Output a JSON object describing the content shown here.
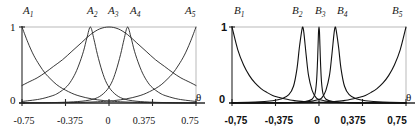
{
  "figure": {
    "panels": [
      {
        "id": "A",
        "top_labels": [
          {
            "base": "A",
            "sub": "1"
          },
          {
            "base": "A",
            "sub": "2"
          },
          {
            "base": "A",
            "sub": "3"
          },
          {
            "base": "A",
            "sub": "4"
          },
          {
            "base": "A",
            "sub": "5"
          }
        ],
        "y_ticks": [
          "1",
          "0"
        ],
        "x_ticks": [
          "-0.75",
          "-0.375",
          "0",
          "0.375",
          "0.75"
        ],
        "x_axis_symbol": "θ"
      },
      {
        "id": "B",
        "top_labels": [
          {
            "base": "B",
            "sub": "1"
          },
          {
            "base": "B",
            "sub": "2"
          },
          {
            "base": "B",
            "sub": "3"
          },
          {
            "base": "B",
            "sub": "4"
          },
          {
            "base": "B",
            "sub": "5"
          }
        ],
        "y_ticks": [
          "1",
          "0"
        ],
        "x_ticks": [
          "-0,75",
          "-0,375",
          "0",
          "0,375",
          "0,75"
        ],
        "x_axis_symbol": "θ"
      }
    ]
  },
  "chart_data": [
    {
      "type": "line",
      "title": "",
      "xlabel": "θ",
      "ylabel": "",
      "xlim": [
        -0.75,
        0.75
      ],
      "ylim": [
        0,
        1
      ],
      "xticks": [
        -0.75,
        -0.375,
        0,
        0.375,
        0.75
      ],
      "xticklabels": [
        "-0.75",
        "-0.375",
        "0",
        "0.375",
        "0.75"
      ],
      "yticks": [
        0,
        1
      ],
      "yticklabels": [
        "0",
        "1"
      ],
      "grid": false,
      "legend": "top-outside",
      "line_color": "#222222",
      "line_width": 0.9,
      "series": [
        {
          "name": "A1",
          "shape": "exponential-decay",
          "center": -0.75,
          "width": 0.42,
          "peak": 1.0,
          "x": [
            -0.75,
            -0.7,
            -0.65,
            -0.6,
            -0.55,
            -0.5,
            -0.45,
            -0.4,
            -0.35,
            -0.3,
            -0.25,
            -0.2,
            -0.15,
            -0.1,
            -0.05,
            0.0,
            0.1,
            0.2,
            0.3,
            0.45,
            0.6,
            0.75
          ],
          "y": [
            1.0,
            0.8,
            0.63,
            0.5,
            0.39,
            0.31,
            0.24,
            0.19,
            0.15,
            0.115,
            0.09,
            0.07,
            0.055,
            0.042,
            0.033,
            0.026,
            0.016,
            0.01,
            0.006,
            0.003,
            0.001,
            0.0
          ]
        },
        {
          "name": "A2",
          "shape": "sharp-peak",
          "center": -0.16,
          "width": 0.1,
          "peak": 1.0,
          "x": [
            -0.75,
            -0.6,
            -0.5,
            -0.45,
            -0.4,
            -0.35,
            -0.3,
            -0.26,
            -0.22,
            -0.19,
            -0.16,
            -0.13,
            -0.1,
            -0.06,
            -0.02,
            0.03,
            0.1,
            0.2,
            0.35,
            0.55,
            0.75
          ],
          "y": [
            0.02,
            0.05,
            0.09,
            0.12,
            0.17,
            0.24,
            0.36,
            0.5,
            0.68,
            0.86,
            1.0,
            0.84,
            0.64,
            0.42,
            0.26,
            0.15,
            0.07,
            0.03,
            0.012,
            0.004,
            0.002
          ]
        },
        {
          "name": "A3",
          "shape": "broad-bell",
          "center": 0.0,
          "width": 0.36,
          "peak": 1.0,
          "x": [
            -0.75,
            -0.7,
            -0.62,
            -0.55,
            -0.48,
            -0.4,
            -0.32,
            -0.24,
            -0.16,
            -0.08,
            0.0,
            0.08,
            0.16,
            0.24,
            0.32,
            0.4,
            0.48,
            0.55,
            0.62,
            0.7,
            0.75
          ],
          "y": [
            0.23,
            0.27,
            0.33,
            0.4,
            0.48,
            0.57,
            0.68,
            0.79,
            0.9,
            0.975,
            1.0,
            0.975,
            0.9,
            0.79,
            0.68,
            0.57,
            0.48,
            0.4,
            0.33,
            0.27,
            0.23
          ]
        },
        {
          "name": "A4",
          "shape": "sharp-peak",
          "center": 0.16,
          "width": 0.1,
          "peak": 1.0,
          "x": [
            -0.75,
            -0.55,
            -0.35,
            -0.2,
            -0.1,
            -0.03,
            0.02,
            0.06,
            0.1,
            0.13,
            0.16,
            0.19,
            0.22,
            0.26,
            0.3,
            0.35,
            0.4,
            0.45,
            0.5,
            0.6,
            0.75
          ],
          "y": [
            0.002,
            0.004,
            0.012,
            0.03,
            0.07,
            0.15,
            0.26,
            0.42,
            0.64,
            0.84,
            1.0,
            0.86,
            0.68,
            0.5,
            0.36,
            0.24,
            0.17,
            0.12,
            0.09,
            0.05,
            0.02
          ]
        },
        {
          "name": "A5",
          "shape": "exponential-rise",
          "center": 0.75,
          "width": 0.42,
          "peak": 1.0,
          "x": [
            -0.75,
            -0.6,
            -0.45,
            -0.3,
            -0.2,
            -0.1,
            0.0,
            0.05,
            0.1,
            0.15,
            0.2,
            0.25,
            0.3,
            0.35,
            0.4,
            0.45,
            0.5,
            0.55,
            0.6,
            0.65,
            0.7,
            0.75
          ],
          "y": [
            0.0,
            0.001,
            0.003,
            0.006,
            0.01,
            0.016,
            0.026,
            0.033,
            0.042,
            0.055,
            0.07,
            0.09,
            0.115,
            0.15,
            0.19,
            0.24,
            0.31,
            0.39,
            0.5,
            0.63,
            0.8,
            1.0
          ]
        }
      ]
    },
    {
      "type": "line",
      "title": "",
      "xlabel": "θ",
      "ylabel": "",
      "xlim": [
        -0.75,
        0.75
      ],
      "ylim": [
        0,
        1
      ],
      "xticks": [
        -0.75,
        -0.375,
        0,
        0.375,
        0.75
      ],
      "xticklabels": [
        "-0,75",
        "-0,375",
        "0",
        "0,375",
        "0,75"
      ],
      "yticks": [
        0,
        1
      ],
      "yticklabels": [
        "0",
        "1"
      ],
      "grid": false,
      "legend": "top-outside",
      "line_color": "#111111",
      "line_width": 1.1,
      "series": [
        {
          "name": "B1",
          "shape": "steep-exponential-decay",
          "center": -0.75,
          "width": 0.22,
          "peak": 1.0,
          "x": [
            -0.75,
            -0.7,
            -0.65,
            -0.6,
            -0.55,
            -0.5,
            -0.45,
            -0.4,
            -0.35,
            -0.3,
            -0.25,
            -0.2,
            -0.15,
            -0.1,
            -0.05,
            0.0,
            0.15,
            0.35,
            0.55,
            0.75
          ],
          "y": [
            1.0,
            0.7,
            0.5,
            0.36,
            0.26,
            0.19,
            0.14,
            0.1,
            0.075,
            0.055,
            0.04,
            0.03,
            0.022,
            0.016,
            0.011,
            0.008,
            0.003,
            0.001,
            0.0,
            0.0
          ]
        },
        {
          "name": "B2",
          "shape": "narrow-peak",
          "center": -0.14,
          "width": 0.055,
          "peak": 1.0,
          "x": [
            -0.75,
            -0.55,
            -0.4,
            -0.32,
            -0.26,
            -0.22,
            -0.19,
            -0.17,
            -0.15,
            -0.14,
            -0.13,
            -0.11,
            -0.09,
            -0.06,
            -0.03,
            0.0,
            0.1,
            0.25,
            0.45,
            0.75
          ],
          "y": [
            0.005,
            0.012,
            0.03,
            0.055,
            0.11,
            0.22,
            0.45,
            0.72,
            0.94,
            1.0,
            0.92,
            0.62,
            0.36,
            0.17,
            0.08,
            0.045,
            0.015,
            0.005,
            0.002,
            0.001
          ]
        },
        {
          "name": "B3",
          "shape": "ultra-narrow-spike",
          "center": 0.0,
          "width": 0.012,
          "peak": 1.0,
          "x": [
            -0.75,
            -0.3,
            -0.12,
            -0.06,
            -0.035,
            -0.022,
            -0.014,
            -0.008,
            -0.004,
            0.0,
            0.004,
            0.008,
            0.014,
            0.022,
            0.035,
            0.06,
            0.12,
            0.3,
            0.75
          ],
          "y": [
            0.002,
            0.006,
            0.02,
            0.05,
            0.12,
            0.27,
            0.5,
            0.76,
            0.94,
            1.0,
            0.94,
            0.76,
            0.5,
            0.27,
            0.12,
            0.05,
            0.02,
            0.006,
            0.002
          ]
        },
        {
          "name": "B4",
          "shape": "narrow-peak",
          "center": 0.14,
          "width": 0.055,
          "peak": 1.0,
          "x": [
            -0.75,
            -0.45,
            -0.25,
            -0.1,
            0.0,
            0.03,
            0.06,
            0.09,
            0.11,
            0.13,
            0.14,
            0.15,
            0.17,
            0.19,
            0.22,
            0.26,
            0.32,
            0.4,
            0.55,
            0.75
          ],
          "y": [
            0.001,
            0.002,
            0.005,
            0.015,
            0.045,
            0.08,
            0.17,
            0.36,
            0.62,
            0.92,
            1.0,
            0.94,
            0.72,
            0.45,
            0.22,
            0.11,
            0.055,
            0.03,
            0.012,
            0.005
          ]
        },
        {
          "name": "B5",
          "shape": "steep-exponential-rise",
          "center": 0.75,
          "width": 0.22,
          "peak": 1.0,
          "x": [
            -0.75,
            -0.55,
            -0.35,
            -0.15,
            0.0,
            0.05,
            0.1,
            0.15,
            0.2,
            0.25,
            0.3,
            0.35,
            0.4,
            0.45,
            0.5,
            0.55,
            0.6,
            0.65,
            0.7,
            0.75
          ],
          "y": [
            0.0,
            0.0,
            0.001,
            0.003,
            0.008,
            0.011,
            0.016,
            0.022,
            0.03,
            0.04,
            0.055,
            0.075,
            0.1,
            0.14,
            0.19,
            0.26,
            0.36,
            0.5,
            0.7,
            1.0
          ]
        }
      ]
    }
  ]
}
